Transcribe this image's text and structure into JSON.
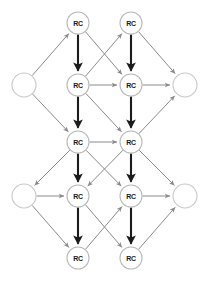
{
  "diagram": {
    "type": "directed-graph",
    "canvas": {
      "width": 205,
      "height": 281,
      "background": "#ffffff"
    },
    "node_label": "RC",
    "colors": {
      "node_fill": "#ffffff",
      "node_stroke": "#b9b9b9",
      "plain_node_stroke": "#c9c9c9",
      "label_color": "#1a1a1a",
      "thin_edge": "#8a8a8a",
      "thick_edge": "#1c1c1c"
    },
    "nodes": [
      {
        "id": "r1c1",
        "label": "RC",
        "x": 78,
        "y": 23,
        "r": 11,
        "kind": "rc"
      },
      {
        "id": "r1c2",
        "label": "RC",
        "x": 131,
        "y": 23,
        "r": 11,
        "kind": "rc"
      },
      {
        "id": "r2c1",
        "label": "RC",
        "x": 78,
        "y": 85,
        "r": 11,
        "kind": "rc"
      },
      {
        "id": "r2c2",
        "label": "RC",
        "x": 131,
        "y": 85,
        "r": 11,
        "kind": "rc"
      },
      {
        "id": "r3c1",
        "label": "RC",
        "x": 78,
        "y": 142,
        "r": 11,
        "kind": "rc"
      },
      {
        "id": "r3c2",
        "label": "RC",
        "x": 131,
        "y": 142,
        "r": 11,
        "kind": "rc"
      },
      {
        "id": "r4c1",
        "label": "RC",
        "x": 78,
        "y": 196,
        "r": 11,
        "kind": "rc"
      },
      {
        "id": "r4c2",
        "label": "RC",
        "x": 131,
        "y": 196,
        "r": 11,
        "kind": "rc"
      },
      {
        "id": "r5c1",
        "label": "RC",
        "x": 78,
        "y": 258,
        "r": 11,
        "kind": "rc"
      },
      {
        "id": "r5c2",
        "label": "RC",
        "x": 131,
        "y": 258,
        "r": 11,
        "kind": "rc"
      },
      {
        "id": "left-top",
        "label": "",
        "x": 24,
        "y": 85,
        "r": 12,
        "kind": "plain"
      },
      {
        "id": "right-top",
        "label": "",
        "x": 185,
        "y": 85,
        "r": 12,
        "kind": "plain"
      },
      {
        "id": "left-bottom",
        "label": "",
        "x": 24,
        "y": 196,
        "r": 12,
        "kind": "plain"
      },
      {
        "id": "right-bottom",
        "label": "",
        "x": 185,
        "y": 196,
        "r": 12,
        "kind": "plain"
      }
    ],
    "edges": [
      {
        "from": "r1c1",
        "to": "r2c1",
        "style": "thick",
        "arrow": true
      },
      {
        "from": "r1c2",
        "to": "r2c2",
        "style": "thick",
        "arrow": true
      },
      {
        "from": "r2c1",
        "to": "r3c1",
        "style": "thick",
        "arrow": true
      },
      {
        "from": "r2c2",
        "to": "r3c2",
        "style": "thick",
        "arrow": true
      },
      {
        "from": "r3c1",
        "to": "r4c1",
        "style": "thick",
        "arrow": true
      },
      {
        "from": "r3c2",
        "to": "r4c2",
        "style": "thick",
        "arrow": true
      },
      {
        "from": "r4c1",
        "to": "r5c1",
        "style": "thick",
        "arrow": true
      },
      {
        "from": "r4c2",
        "to": "r5c2",
        "style": "thick",
        "arrow": true
      },
      {
        "from": "r2c1",
        "to": "r2c2",
        "style": "thin",
        "arrow": true
      },
      {
        "from": "r3c1",
        "to": "r3c2",
        "style": "thin",
        "arrow": true
      },
      {
        "from": "left-bottom",
        "to": "r4c1",
        "style": "thin",
        "arrow": true
      },
      {
        "from": "r2c2",
        "to": "right-top",
        "style": "thin",
        "arrow": true
      },
      {
        "from": "r4c2",
        "to": "right-bottom",
        "style": "thin",
        "arrow": true
      },
      {
        "from": "r1c1",
        "to": "r2c2",
        "style": "thin",
        "arrow": true
      },
      {
        "from": "r2c1",
        "to": "r1c2",
        "style": "thin",
        "arrow": true
      },
      {
        "from": "r2c1",
        "to": "r3c2",
        "style": "thin",
        "arrow": true
      },
      {
        "from": "r3c1",
        "to": "r4c2",
        "style": "thin",
        "arrow": true
      },
      {
        "from": "r3c2",
        "to": "r4c1",
        "style": "thin",
        "arrow": true
      },
      {
        "from": "r4c1",
        "to": "r5c2",
        "style": "thin",
        "arrow": true
      },
      {
        "from": "r5c1",
        "to": "r4c2",
        "style": "thin",
        "arrow": true
      },
      {
        "from": "left-top",
        "to": "r1c1",
        "style": "thin",
        "arrow": true
      },
      {
        "from": "left-top",
        "to": "r3c1",
        "style": "thin",
        "arrow": true
      },
      {
        "from": "r1c2",
        "to": "right-top",
        "style": "thin",
        "arrow": true
      },
      {
        "from": "r3c2",
        "to": "right-top",
        "style": "thin",
        "arrow": true
      },
      {
        "from": "r3c1",
        "to": "left-bottom",
        "style": "thin",
        "arrow": true
      },
      {
        "from": "left-bottom",
        "to": "r5c1",
        "style": "thin",
        "arrow": true
      },
      {
        "from": "r3c2",
        "to": "right-bottom",
        "style": "thin",
        "arrow": true
      },
      {
        "from": "r5c2",
        "to": "right-bottom",
        "style": "thin",
        "arrow": true
      }
    ]
  }
}
